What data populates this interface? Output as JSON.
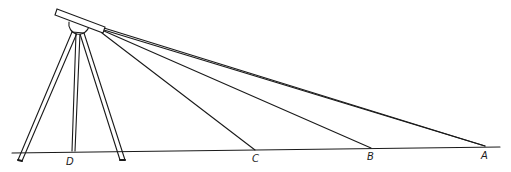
{
  "diagram": {
    "stroke_color": "#1a1a1a",
    "background": "#ffffff",
    "instrument": {
      "tube": {
        "x1": 57,
        "y1": 11,
        "x2": 104,
        "y2": 30,
        "thickness": 7
      },
      "head_center": {
        "x": 78,
        "y": 24
      },
      "ray_origin": {
        "x": 104,
        "y": 30
      }
    },
    "ground_line": {
      "x1": 12,
      "y1": 153,
      "x2": 500,
      "y2": 147
    },
    "points": [
      {
        "id": "D",
        "label": "D",
        "x": 73,
        "y": 152
      },
      {
        "id": "C",
        "label": "C",
        "x": 255,
        "y": 150
      },
      {
        "id": "B",
        "label": "B",
        "x": 371,
        "y": 148
      },
      {
        "id": "A",
        "label": "A",
        "x": 485,
        "y": 146
      }
    ],
    "labels": {
      "D": "D",
      "C": "C",
      "B": "B",
      "A": "A"
    }
  }
}
